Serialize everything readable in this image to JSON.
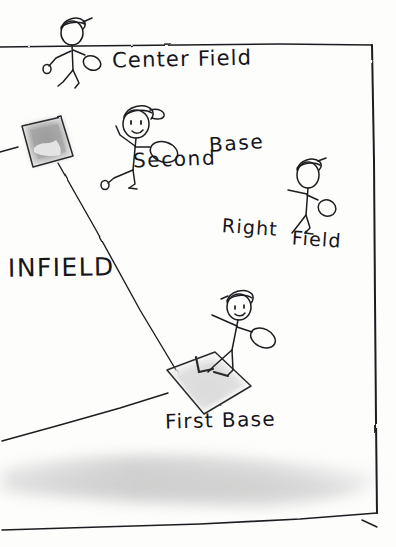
{
  "drawing": {
    "title": "Hand-drawn baseball field diagram",
    "medium": "pencil sketch on white paper",
    "paper_color": "#fdfdfc",
    "ink_color": "#16161a",
    "base_fill_color": "#b9b9b9",
    "smudge_color": "#c9c9c9"
  },
  "labels": {
    "center_field": "Center Field",
    "second_base": "Second Base",
    "second_word_1": "Second",
    "second_word_2": "Base",
    "right_field": "Right Field",
    "right_word_1": "Right",
    "right_word_2": "Field",
    "infield": "INFIELD",
    "first_base": "First Base"
  },
  "figures": [
    {
      "name": "center-fielder",
      "label": "Center Field",
      "has_cap": true,
      "has_glove": true,
      "glove_side": "right"
    },
    {
      "name": "second-baseman",
      "label": "Second Base",
      "has_cap": true,
      "has_glove": true,
      "has_face": true,
      "glove_side": "right"
    },
    {
      "name": "right-fielder",
      "label": "Right Field",
      "has_cap": true,
      "has_glove": true,
      "glove_side": "right"
    },
    {
      "name": "first-baseman",
      "label": "First Base",
      "has_cap": true,
      "has_glove": true,
      "has_face": true,
      "glove_side": "right"
    }
  ],
  "bases": [
    {
      "name": "second-base",
      "label": "Second Base",
      "shading": "gray"
    },
    {
      "name": "first-base",
      "label": "First Base",
      "shading": "light gray"
    }
  ],
  "field_regions": [
    {
      "name": "infield",
      "label": "INFIELD"
    }
  ]
}
